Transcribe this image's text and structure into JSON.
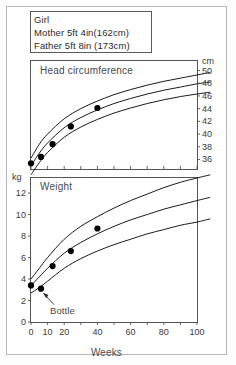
{
  "header": {
    "lines": [
      "Girl",
      "Mother 5ft 4in(162cm)",
      "Father 5ft 8in (173cm)"
    ]
  },
  "chart_data": [
    {
      "type": "line",
      "name": "head-circumference",
      "title": "Head circumference",
      "xlabel": "",
      "ylabel": "cm",
      "xlim": [
        0,
        100
      ],
      "ylim": [
        34.5,
        51.5
      ],
      "grid": false,
      "legend": false,
      "yticks": [
        36,
        38,
        40,
        42,
        44,
        46,
        48,
        50
      ],
      "ytick_labels": [
        "36",
        "38",
        "40",
        "42",
        "44",
        "46",
        "48",
        "50"
      ],
      "xticks": [
        0,
        10,
        20,
        30,
        40,
        50,
        60,
        70,
        80,
        90,
        100
      ],
      "series": [
        {
          "name": "centile-upper",
          "x": [
            0,
            5,
            10,
            20,
            30,
            40,
            50,
            60,
            70,
            80,
            90,
            100,
            108
          ],
          "values": [
            36.2,
            38.4,
            40.0,
            42.4,
            44.0,
            45.2,
            46.2,
            47.0,
            47.7,
            48.3,
            48.8,
            49.3,
            49.7
          ]
        },
        {
          "name": "centile-middle",
          "x": [
            0,
            5,
            10,
            20,
            30,
            40,
            50,
            60,
            70,
            80,
            90,
            100,
            108
          ],
          "values": [
            35.0,
            37.0,
            38.6,
            41.0,
            42.6,
            43.8,
            44.8,
            45.6,
            46.3,
            46.9,
            47.4,
            47.9,
            48.2
          ]
        },
        {
          "name": "centile-lower",
          "x": [
            0,
            5,
            10,
            20,
            30,
            40,
            50,
            60,
            70,
            80,
            90,
            100,
            108
          ],
          "values": [
            33.6,
            35.5,
            37.1,
            39.5,
            41.1,
            42.3,
            43.3,
            44.1,
            44.8,
            45.4,
            45.9,
            46.3,
            46.6
          ]
        },
        {
          "name": "measurements",
          "marker": "filled-circle",
          "x": [
            0,
            6,
            13,
            24,
            40
          ],
          "values": [
            35.4,
            36.4,
            38.4,
            41.2,
            44.1
          ]
        }
      ]
    },
    {
      "type": "line",
      "name": "weight",
      "title": "Weight",
      "xlabel": "Weeks",
      "ylabel": "kg",
      "xlim": [
        0,
        100
      ],
      "ylim": [
        0,
        13.4
      ],
      "grid": false,
      "legend": false,
      "yticks": [
        0,
        2,
        4,
        6,
        8,
        10,
        12
      ],
      "ytick_labels": [
        "0",
        "2",
        "4",
        "6",
        "8",
        "10",
        "12"
      ],
      "xticks": [
        0,
        10,
        20,
        30,
        40,
        50,
        60,
        70,
        80,
        90,
        100
      ],
      "xtick_labels_shown": [
        "0",
        "10",
        "20",
        "40",
        "60",
        "80",
        "100"
      ],
      "annotations": [
        {
          "text": "Bottle",
          "x": 6,
          "y": 3.1,
          "arrow": true
        }
      ],
      "series": [
        {
          "name": "centile-upper",
          "x": [
            0,
            5,
            10,
            20,
            30,
            40,
            50,
            60,
            70,
            80,
            90,
            100,
            108
          ],
          "values": [
            4.0,
            5.0,
            6.0,
            7.7,
            8.9,
            9.8,
            10.6,
            11.3,
            11.9,
            12.5,
            13.0,
            13.4,
            13.7
          ]
        },
        {
          "name": "centile-middle",
          "x": [
            0,
            5,
            10,
            20,
            30,
            40,
            50,
            60,
            70,
            80,
            90,
            100,
            108
          ],
          "values": [
            3.4,
            4.2,
            5.0,
            6.4,
            7.4,
            8.2,
            8.9,
            9.5,
            10.0,
            10.5,
            10.9,
            11.3,
            11.6
          ]
        },
        {
          "name": "centile-lower",
          "x": [
            0,
            5,
            10,
            20,
            30,
            40,
            50,
            60,
            70,
            80,
            90,
            100,
            108
          ],
          "values": [
            2.7,
            3.2,
            3.8,
            5.0,
            5.9,
            6.6,
            7.2,
            7.7,
            8.2,
            8.6,
            9.0,
            9.3,
            9.6
          ]
        },
        {
          "name": "measurements",
          "marker": "filled-circle",
          "x": [
            0,
            6,
            13,
            24,
            40
          ],
          "values": [
            3.4,
            3.1,
            5.2,
            6.6,
            8.7
          ]
        }
      ]
    }
  ],
  "labels": {
    "hc_unit": "cm",
    "wt_unit": "kg",
    "x_axis_title": "Weeks",
    "hc_title": "Head circumference",
    "wt_title": "Weight",
    "bottle": "Bottle"
  },
  "colors": {
    "frame": "#555555",
    "curve": "#000000",
    "marker": "#000000",
    "text": "#3a3a3a",
    "background": "#ffffff"
  }
}
